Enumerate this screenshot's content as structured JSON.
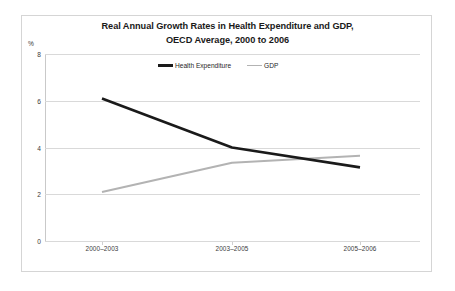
{
  "chart_data": {
    "type": "line",
    "title": "Real Annual Growth Rates in Health Expenditure and GDP, OECD Average, 2000 to 2006",
    "title_line1": "Real Annual Growth Rates in Health Expenditure and GDP,",
    "title_line2": "OECD Average, 2000 to 2006",
    "xlabel": "",
    "ylabel": "%",
    "categories": [
      "2000–2003",
      "2003–2005",
      "2005–2006"
    ],
    "series": [
      {
        "name": "Health Expenditure",
        "color": "#1a1a1a",
        "values": [
          6.1,
          4.0,
          3.15
        ]
      },
      {
        "name": "GDP",
        "color": "#b3b3b3",
        "values": [
          2.1,
          3.35,
          3.65
        ]
      }
    ],
    "ylim": [
      0,
      8
    ],
    "yticks": [
      0,
      2,
      4,
      6,
      8
    ],
    "ytick_labels": [
      "0",
      "2",
      "4",
      "6",
      "8"
    ],
    "grid": true,
    "legend_position": "top-center"
  },
  "axis": {
    "unit_label": "%",
    "y_labels": [
      "8",
      "6",
      "4",
      "2",
      "0"
    ],
    "x_labels": [
      "2000–2003",
      "2003–2005",
      "2005–2006"
    ]
  },
  "legend": {
    "items": [
      {
        "label": "Health Expenditure",
        "color": "#1a1a1a"
      },
      {
        "label": "GDP",
        "color": "#b3b3b3"
      }
    ]
  },
  "colors": {
    "health_expenditure": "#1a1a1a",
    "gdp": "#b3b3b3",
    "gridline": "#d9d9d9",
    "frame": "#d5d5d5",
    "text": "#1a1a1a"
  }
}
